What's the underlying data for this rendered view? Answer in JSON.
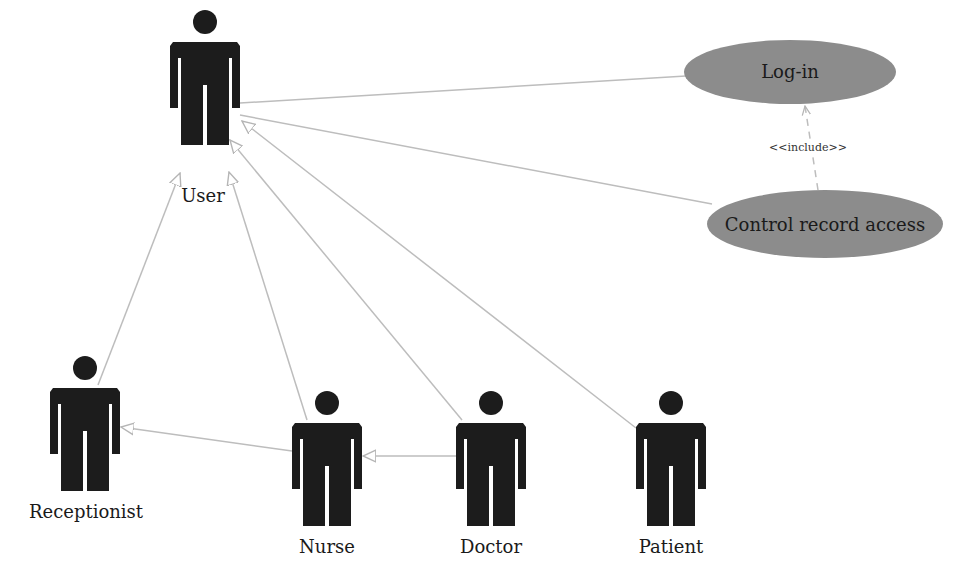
{
  "diagram": {
    "type": "UML use case diagram",
    "actors": [
      {
        "id": "user",
        "label": "User"
      },
      {
        "id": "receptionist",
        "label": "Receptionist"
      },
      {
        "id": "nurse",
        "label": "Nurse"
      },
      {
        "id": "doctor",
        "label": "Doctor"
      },
      {
        "id": "patient",
        "label": "Patient"
      }
    ],
    "use_cases": [
      {
        "id": "login",
        "label": "Log-in"
      },
      {
        "id": "control",
        "label": "Control record access"
      }
    ],
    "relations": [
      {
        "from": "user",
        "to": "login",
        "kind": "association"
      },
      {
        "from": "user",
        "to": "control",
        "kind": "association"
      },
      {
        "from": "receptionist",
        "to": "user",
        "kind": "generalization"
      },
      {
        "from": "nurse",
        "to": "user",
        "kind": "generalization"
      },
      {
        "from": "doctor",
        "to": "user",
        "kind": "generalization"
      },
      {
        "from": "patient",
        "to": "user",
        "kind": "generalization"
      },
      {
        "from": "nurse",
        "to": "receptionist",
        "kind": "generalization"
      },
      {
        "from": "doctor",
        "to": "nurse",
        "kind": "generalization"
      },
      {
        "from": "control",
        "to": "login",
        "kind": "include",
        "label": "<<include>>"
      }
    ],
    "colors": {
      "actor": "#1c1c1c",
      "use_case_fill": "#8c8c8c",
      "line": "#bdbdbd"
    }
  }
}
